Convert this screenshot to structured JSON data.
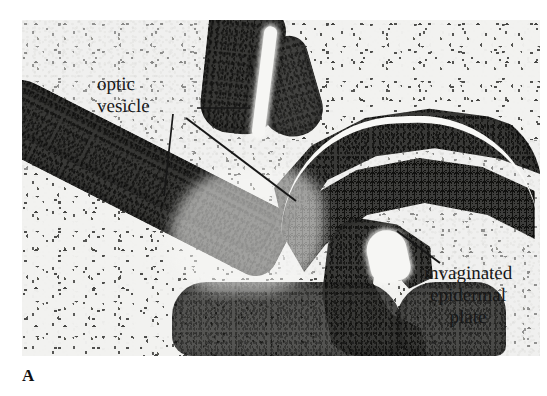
{
  "figure": {
    "panel_letter": "A",
    "plate_type": "histological-micrograph",
    "background_color": "#ffffff",
    "plate_background_color": "#ececeb",
    "ink_color": "#171717"
  },
  "annotations": [
    {
      "name": "optic-vesicle",
      "text": "optic\nvesicle",
      "lines": [
        "optic",
        "vesicle"
      ],
      "align": "left",
      "leaders": 3
    },
    {
      "name": "invaginated-epidermal-plate",
      "text": "invaginated\nepidermal\nplate",
      "lines": [
        "invaginated",
        "epidermal",
        "plate"
      ],
      "align": "center",
      "leaders": 1
    }
  ],
  "leader_lines": [
    {
      "name": "leader-optic-vesicle-horizontal",
      "x1": 197,
      "y1": 108,
      "x2": 250,
      "y2": 108
    },
    {
      "name": "leader-optic-vesicle-vertical",
      "x1": 173,
      "y1": 114,
      "x2": 164,
      "y2": 196
    },
    {
      "name": "leader-optic-vesicle-diagonal",
      "x1": 186,
      "y1": 118,
      "x2": 296,
      "y2": 201
    },
    {
      "name": "leader-invaginated-plate",
      "x1": 397,
      "y1": 231,
      "x2": 440,
      "y2": 263
    }
  ],
  "micrograph": {
    "left": 22,
    "top": 20,
    "width": 518,
    "height": 336,
    "regions": [
      {
        "name": "upper-left-neuroepithelium",
        "tissue": "optic vesicle wall"
      },
      {
        "name": "upper-middle-neuroepithelium",
        "tissue": "optic vesicle wall"
      },
      {
        "name": "upper-right-mesenchyme",
        "tissue": "mesenchyme"
      },
      {
        "name": "right-optic-cup-epithelium",
        "tissue": "optic vesicle wall"
      },
      {
        "name": "invaginating-lens-placode",
        "tissue": "epidermal plate"
      },
      {
        "name": "lower-left-mesenchyme",
        "tissue": "mesenchyme"
      },
      {
        "name": "lower-middle-mesenchyme",
        "tissue": "mesenchyme"
      }
    ]
  }
}
